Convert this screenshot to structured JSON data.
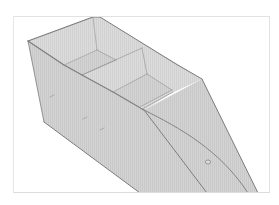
{
  "figure": {
    "subject": "3D model of flat-bottom boat hull with seat compartments",
    "view": "isometric",
    "colors": {
      "background": "#ffffff",
      "frame_border": "#e0e0e0",
      "hull_fill": "#cfcfcf",
      "hull_fill_light": "#d8d8d8",
      "hull_fill_dark": "#c4c4c4",
      "edge_stroke": "#7a7a7a",
      "inner_stroke": "#8e8e8e"
    },
    "parts": {
      "hull": "hull",
      "rear_seat": "rear-seat",
      "middle_seat": "middle-seat",
      "bow": "bow",
      "keel_line": "keel-line",
      "chine_line": "chine-line",
      "drain_plug": "drain-plug"
    }
  }
}
